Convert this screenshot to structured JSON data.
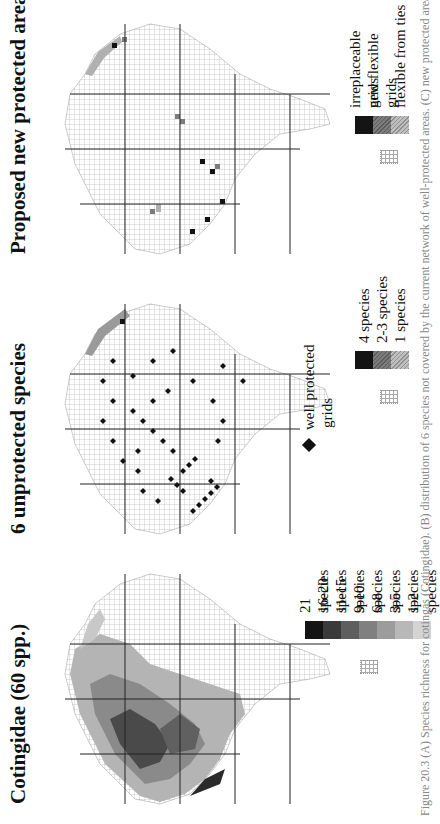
{
  "figure": {
    "caption": "Figure 20.3  (A) Species richness for cotingas (Cotingidae). (B) distribution of 6 species not covered by the current network of well-protected areas. (C) new protected areas needed",
    "orientation": "rotated 90° counter-clockwise (landscape page)"
  },
  "panels": [
    {
      "id": "A",
      "title": "Cotingidae (60 spp.)",
      "legend_title": "",
      "legend": [
        {
          "label": "21 species",
          "color": "#141414"
        },
        {
          "label": "16-20 species",
          "color": "#3a3a3a"
        },
        {
          "label": "11-15 species",
          "color": "#5e5e5e"
        },
        {
          "label": "9-10 species",
          "color": "#808080"
        },
        {
          "label": "6-8 species",
          "color": "#9c9c9c"
        },
        {
          "label": "3-5 species",
          "color": "#b8b8b8"
        },
        {
          "label": "1-2 species",
          "color": "#d4d4d4"
        }
      ]
    },
    {
      "id": "B",
      "title": "6 unprotected species",
      "marker_legend": {
        "symbol": "diamond",
        "label_line1": "well protected",
        "label_line2": "grids"
      },
      "legend": [
        {
          "label": "4 species",
          "color": "#141414"
        },
        {
          "label": "2-3 species",
          "color": "#7c7c7c"
        },
        {
          "label": "1 species",
          "color": "#c0c0c0"
        }
      ]
    },
    {
      "id": "C",
      "title": "Proposed new protected areas",
      "legend": [
        {
          "label": "irreplaceable grids",
          "color": "#141414"
        },
        {
          "label": "new flexible grids",
          "color": "#7c7c7c"
        },
        {
          "label": "flexible from ties",
          "color": "#c0c0c0"
        }
      ]
    }
  ]
}
